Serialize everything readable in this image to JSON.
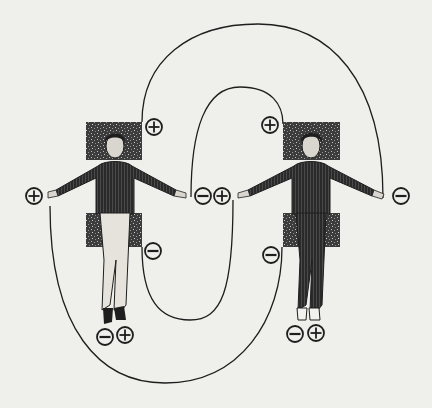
{
  "diagram": {
    "colors": {
      "background": "#efefec",
      "ink": "#1e1e1e",
      "block": "#3a3a3a"
    },
    "figures": [
      {
        "id": "left-person",
        "clothing": "dark sweater, light trousers",
        "labels": {
          "head": "+",
          "right_hand": "+",
          "left_hand": "−",
          "hips": "−",
          "left_foot": "−",
          "right_foot": "+"
        }
      },
      {
        "id": "right-person",
        "clothing": "dark sweater, dark trousers",
        "labels": {
          "head": "+",
          "right_hand": "+",
          "left_hand": "−",
          "hips": "−",
          "left_foot": "−",
          "right_foot": "+"
        }
      }
    ],
    "symbols": {
      "plus": "⊕",
      "minus": "⊖"
    },
    "connections": [
      {
        "from": "left-person.head(+)",
        "to": "right-person.left_hand(−)",
        "path": "outer-top-arc"
      },
      {
        "from": "left-person.left_hand(−)",
        "to": "right-person.head(+)",
        "path": "inner-top-arc"
      },
      {
        "from": "left-person.hips(−)",
        "to": "right-person.right_hand(+)",
        "path": "inner-bottom-arc"
      },
      {
        "from": "left-person.right_hand(+)",
        "to": "right-person.hips(−)",
        "path": "outer-bottom-arc"
      }
    ]
  }
}
